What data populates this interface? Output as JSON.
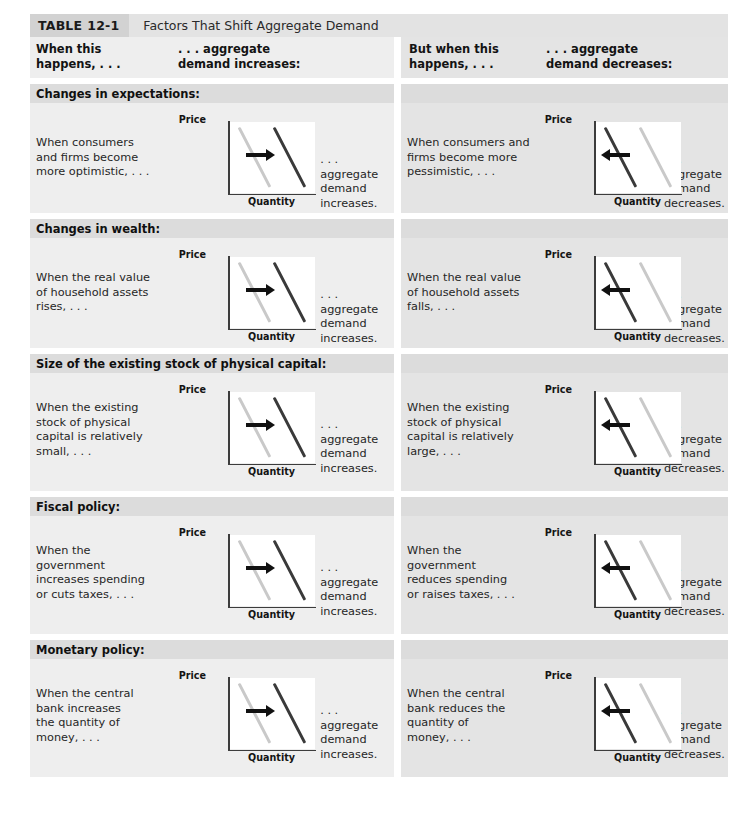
{
  "title": {
    "tag_label": "TABLE",
    "tag_number": "12-1",
    "caption": "Factors That Shift Aggregate Demand"
  },
  "column_headers": [
    "When this\nhappens, . . .",
    ". . . aggregate\ndemand increases:",
    "But when this\nhappens, . . .",
    ". . . aggregate\ndemand decreases:"
  ],
  "column_headers_lines": {
    "c1_l1": "When this",
    "c1_l2": "happens, . . .",
    "c2_l1": ". . . aggregate",
    "c2_l2": "demand increases:",
    "c3_l1": "But when this",
    "c3_l2": "happens, . . .",
    "c4_l1": ". . . aggregate",
    "c4_l2": "demand decreases:"
  },
  "chart_labels": {
    "y_axis": "Price",
    "x_axis": "Quantity"
  },
  "colors": {
    "ad_initial": "#c9c9c9",
    "ad_shifted": "#3a3a3a",
    "arrow": "#111111",
    "band_section": "#dcdcdc",
    "half_left_bg": "#eeeeee",
    "half_right_bg": "#e4e4e4",
    "title_tag_bg": "#d2d2d2",
    "title_bar_bg": "#e3e3e3"
  },
  "sections": [
    {
      "heading": "Changes in expectations:",
      "increase_cause": "When consumers and firms become more optimistic, . . .",
      "increase_cause_lines": [
        "When consumers",
        "and firms become",
        "more optimistic, . . ."
      ],
      "increase_result_lines": [
        ". . . aggregate",
        "demand increases."
      ],
      "decrease_cause": "When consumers and firms become more pessimistic, . . .",
      "decrease_cause_lines": [
        "When consumers and",
        "firms become more",
        "pessimistic, . . ."
      ],
      "decrease_result_lines": [
        ". . . aggregate",
        "demand decreases."
      ]
    },
    {
      "heading": "Changes in wealth:",
      "increase_cause": "When the real value of household assets rises, . . .",
      "increase_cause_lines": [
        "When the real value",
        "of household assets",
        "rises, . . ."
      ],
      "increase_result_lines": [
        ". . . aggregate",
        "demand increases."
      ],
      "decrease_cause": "When the real value of household assets falls, . . .",
      "decrease_cause_lines": [
        "When the real value",
        "of household assets",
        "falls, . . ."
      ],
      "decrease_result_lines": [
        ". . . aggregate",
        "demand decreases."
      ]
    },
    {
      "heading": "Size of the existing stock of physical capital:",
      "increase_cause": "When the existing stock of physical capital is relatively small, . . .",
      "increase_cause_lines": [
        "When the existing",
        "stock of physical",
        "capital is relatively",
        "small, . . ."
      ],
      "increase_result_lines": [
        ". . . aggregate",
        "demand increases."
      ],
      "decrease_cause": "When the existing stock of physical capital is relatively large, . . .",
      "decrease_cause_lines": [
        "When the existing",
        "stock of physical",
        "capital is relatively",
        "large, . . ."
      ],
      "decrease_result_lines": [
        ". . . aggregate",
        "demand decreases."
      ]
    },
    {
      "heading": "Fiscal policy:",
      "increase_cause": "When the government increases spending or cuts taxes, . . .",
      "increase_cause_lines": [
        "When the",
        "government",
        "increases spending",
        "or cuts taxes, . . ."
      ],
      "increase_result_lines": [
        ". . . aggregate",
        "demand increases."
      ],
      "decrease_cause": "When the government reduces spending or raises taxes, . . .",
      "decrease_cause_lines": [
        "When the",
        "government",
        "reduces spending",
        "or raises taxes, . . ."
      ],
      "decrease_result_lines": [
        ". . . aggregate",
        "demand decreases."
      ]
    },
    {
      "heading": "Monetary policy:",
      "increase_cause": "When the central bank increases the quantity of money, . . .",
      "increase_cause_lines": [
        "When the central",
        "bank increases",
        "the quantity of",
        "money, . . ."
      ],
      "increase_result_lines": [
        ". . . aggregate",
        "demand increases."
      ],
      "decrease_cause": "When the central bank reduces the quantity of money, . . .",
      "decrease_cause_lines": [
        "When the central",
        "bank reduces the",
        "quantity of",
        "money, . . ."
      ],
      "decrease_result_lines": [
        ". . . aggregate",
        "demand decreases."
      ]
    }
  ],
  "chart_data": {
    "type": "line",
    "xlabel": "Quantity",
    "ylabel": "Price",
    "grid": false,
    "legend": "none",
    "note": "Each cell shows two downward-sloping aggregate demand curves; the light gray curve is the original AD and the dark curve is the shifted AD. An arrow indicates the direction of the shift.",
    "variants": [
      {
        "name": "aggregate-demand-increase",
        "arrow_direction": "right",
        "series": [
          {
            "name": "AD original",
            "color": "#c9c9c9",
            "x": [
              0.12,
              0.48
            ],
            "y": [
              0.92,
              0.08
            ]
          },
          {
            "name": "AD shifted",
            "color": "#3a3a3a",
            "x": [
              0.52,
              0.88
            ],
            "y": [
              0.92,
              0.08
            ]
          }
        ]
      },
      {
        "name": "aggregate-demand-decrease",
        "arrow_direction": "left",
        "series": [
          {
            "name": "AD original",
            "color": "#c9c9c9",
            "x": [
              0.52,
              0.88
            ],
            "y": [
              0.92,
              0.08
            ]
          },
          {
            "name": "AD shifted",
            "color": "#3a3a3a",
            "x": [
              0.12,
              0.48
            ],
            "y": [
              0.92,
              0.08
            ]
          }
        ]
      }
    ]
  }
}
